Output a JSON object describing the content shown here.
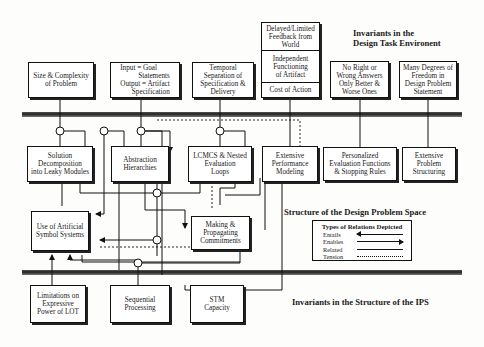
{
  "headings": {
    "task_environment": [
      "Invariants in the",
      "Design Task Environent"
    ],
    "problem_space": "Structure of the Design Problem Space",
    "ips": "Invariants in the Structure of the IPS"
  },
  "task_env_boxes": [
    {
      "id": "size",
      "lines": [
        "Size & Complexity",
        "of Problem"
      ]
    },
    {
      "id": "io",
      "lines": [
        "Input = Goal",
        "Statements",
        "Output = Artifact",
        "Specification"
      ]
    },
    {
      "id": "temporal",
      "lines": [
        "Temporal",
        "Separation of",
        "Specification &",
        "Delivery"
      ]
    },
    {
      "id": "feedback_group",
      "cells": [
        [
          "Delayed/Limited",
          "Feedback from",
          "World"
        ],
        [
          "Independent",
          "Functioning",
          "of Artifact"
        ],
        [
          "Cost of Action"
        ]
      ]
    },
    {
      "id": "no_right",
      "lines": [
        "No Right or",
        "Wrong Answers",
        "Only Better &",
        "Worse Ones"
      ]
    },
    {
      "id": "degrees",
      "lines": [
        "Many Degrees of",
        "Freedom in",
        "Design Problem",
        "Statement"
      ]
    }
  ],
  "problem_space_boxes": [
    {
      "id": "decomp",
      "lines": [
        "Solution",
        "Decomposition",
        "into Leaky Modules"
      ]
    },
    {
      "id": "abstraction",
      "lines": [
        "Abstraction",
        "Hierarchies"
      ]
    },
    {
      "id": "lcmcs",
      "lines": [
        "LCMCS & Nested",
        "Evaluation",
        "Loops"
      ]
    },
    {
      "id": "performance",
      "lines": [
        "Extensive",
        "Performance",
        "Modeling"
      ]
    },
    {
      "id": "personalized",
      "lines": [
        "Personalized",
        "Evaluation Functions",
        "& Stopping Rules"
      ]
    },
    {
      "id": "structuring",
      "lines": [
        "Extensive",
        "Problem",
        "Structuring"
      ]
    },
    {
      "id": "symbol",
      "lines": [
        "Use of Artificial",
        "Symbol Systems"
      ]
    },
    {
      "id": "commitments",
      "lines": [
        "Making &",
        "Propagating",
        "Commitments"
      ]
    }
  ],
  "ips_boxes": [
    {
      "id": "lot",
      "lines": [
        "Limitations on",
        "Expressive",
        "Power of LOT"
      ]
    },
    {
      "id": "sequential",
      "lines": [
        "Sequential",
        "Processing"
      ]
    },
    {
      "id": "stm",
      "lines": [
        "STM",
        "Capacity"
      ]
    }
  ],
  "legend": {
    "title": "Types of Relations Depicted",
    "items": [
      {
        "label": "Entails",
        "style": "arrow-left"
      },
      {
        "label": "Enables",
        "style": "arrow-right"
      },
      {
        "label": "Related",
        "style": "solid"
      },
      {
        "label": "Tension",
        "style": "dotted"
      }
    ]
  }
}
